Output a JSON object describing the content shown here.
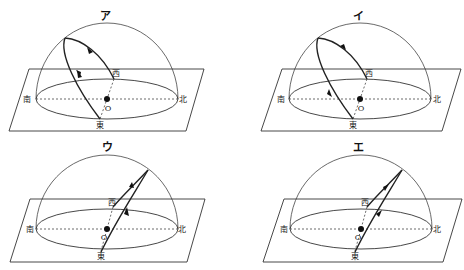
{
  "panels": [
    {
      "id": "a",
      "title": "ア",
      "center": [
        107,
        99
      ],
      "path_type": "south_high",
      "arrows": "east_to_west",
      "labels": {
        "south": "南",
        "north": "北",
        "east": "東",
        "west": "西",
        "origin": "O"
      }
    },
    {
      "id": "i",
      "title": "イ",
      "center": [
        360,
        99
      ],
      "path_type": "south_high",
      "arrows": "west_to_east",
      "labels": {
        "south": "南",
        "north": "北",
        "east": "東",
        "west": "西",
        "origin": "O"
      }
    },
    {
      "id": "u",
      "title": "ウ",
      "center": [
        107,
        229
      ],
      "path_type": "north_high",
      "arrows": "east_to_west",
      "labels": {
        "south": "南",
        "north": "北",
        "east": "東",
        "west": "西",
        "origin": "O"
      }
    },
    {
      "id": "e",
      "title": "エ",
      "center": [
        361,
        229
      ],
      "path_type": "north_high",
      "arrows": "west_to_east",
      "labels": {
        "south": "南",
        "north": "北",
        "east": "東",
        "west": "西",
        "origin": "O"
      }
    }
  ],
  "colors": {
    "line": "#222222",
    "background": "#ffffff"
  }
}
